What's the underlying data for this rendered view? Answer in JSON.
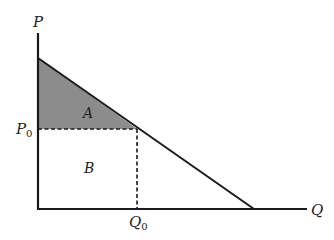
{
  "diagram": {
    "type": "supply-demand-surplus",
    "axes": {
      "y_label": "P",
      "x_label": "Q"
    },
    "tick_labels": {
      "price": "P",
      "price_sub": "0",
      "quantity": "Q",
      "quantity_sub": "0"
    },
    "regions": [
      {
        "id": "A",
        "label": "A",
        "fill": "#8c8c8c",
        "shape": "triangle"
      },
      {
        "id": "B",
        "label": "B",
        "fill": "#ffffff",
        "shape": "rectangle"
      }
    ],
    "colors": {
      "line": "#1a1a1a",
      "shade": "#8c8c8c",
      "text": "#222222"
    }
  }
}
